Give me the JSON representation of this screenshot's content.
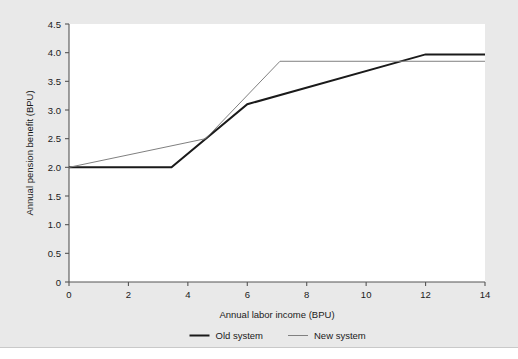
{
  "chart_data": {
    "type": "line",
    "title": "",
    "xlabel": "Annual labor income (BPU)",
    "ylabel": "Annual pension benefit (BPU)",
    "xlim": [
      0,
      14
    ],
    "ylim": [
      0,
      4.5
    ],
    "xticks": [
      0,
      2,
      4,
      6,
      8,
      10,
      12,
      14
    ],
    "xtick_labels": [
      "0",
      "2",
      "4",
      "6",
      "8",
      "10",
      "12",
      "14"
    ],
    "yticks": [
      0,
      0.5,
      1.0,
      1.5,
      2.0,
      2.5,
      3.0,
      3.5,
      4.0,
      4.5
    ],
    "ytick_labels": [
      "0",
      "0.5",
      "1.0",
      "1.5",
      "2.0",
      "2.5",
      "3.0",
      "3.5",
      "4.0",
      "4.5"
    ],
    "grid": false,
    "legend_position": "below-axis-center",
    "series": [
      {
        "name": "Old system",
        "color": "#1a1a1a",
        "width": 2.0,
        "x": [
          0,
          3.45,
          6.0,
          12.0,
          14.0
        ],
        "y": [
          2.0,
          2.0,
          3.1,
          3.97,
          3.97
        ]
      },
      {
        "name": "New system",
        "color": "#808080",
        "width": 1.0,
        "x": [
          0,
          4.6,
          7.1,
          14.0
        ],
        "y": [
          2.0,
          2.5,
          3.85,
          3.85
        ]
      }
    ]
  },
  "legend": {
    "items": [
      {
        "label": "Old system",
        "color": "#1a1a1a",
        "width": 2.0
      },
      {
        "label": "New system",
        "color": "#808080",
        "width": 1.0
      }
    ]
  }
}
